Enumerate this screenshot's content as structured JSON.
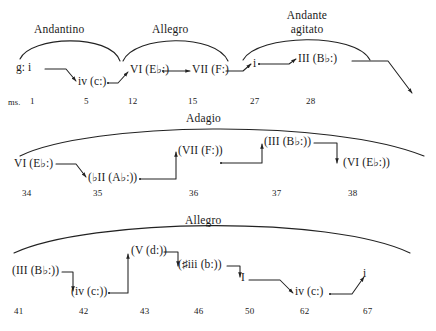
{
  "figure": {
    "type": "harmonic-analysis-diagram",
    "ms_label": "ms.",
    "line_color": "#222222",
    "text_color": "#1a1a1a",
    "background": "#ffffff"
  },
  "rows": [
    {
      "id": "row-1",
      "tempos": [
        {
          "label": "Andantino"
        },
        {
          "label": "Allegro"
        },
        {
          "label": "Andante\nagitato"
        }
      ],
      "tempo_1": "Andantino",
      "tempo_2": "Allegro",
      "tempo_3_line1": "Andante",
      "tempo_3_line2": "agitato",
      "chords": [
        {
          "text": "g: i",
          "roman": "i",
          "key": "g:",
          "measure": "1"
        },
        {
          "text": "iv (c:)",
          "roman": "iv",
          "key": "(c:)",
          "measure": "5"
        },
        {
          "text": "VI (E♭:)",
          "roman": "VI",
          "key": "(E♭:)",
          "measure": "12"
        },
        {
          "text": "VII (F:)",
          "roman": "VII",
          "key": "(F:)",
          "measure": "15"
        },
        {
          "text": "i",
          "roman": "i",
          "key": "",
          "measure": "27"
        },
        {
          "text": "III (B♭:)",
          "roman": "III",
          "key": "(B♭:)",
          "measure": "28"
        }
      ],
      "measures": [
        "1",
        "5",
        "12",
        "15",
        "27",
        "28"
      ]
    },
    {
      "id": "row-2",
      "tempos": [
        {
          "label": "Adagio"
        }
      ],
      "tempo_1": "Adagio",
      "chords": [
        {
          "text": "VI (E♭:)",
          "roman": "VI",
          "key": "(E♭:)",
          "measure": "34"
        },
        {
          "text": "(♭II (A♭:))",
          "roman": "♭II",
          "key": "(A♭:)",
          "measure": "35"
        },
        {
          "text": "(VII (F:))",
          "roman": "VII",
          "key": "(F:)",
          "measure": "36"
        },
        {
          "text": "(III (B♭:))",
          "roman": "III",
          "key": "(B♭:)",
          "measure": "37"
        },
        {
          "text": "(VI (E♭:))",
          "roman": "VI",
          "key": "(E♭:)",
          "measure": "38"
        }
      ],
      "measures": [
        "34",
        "35",
        "36",
        "37",
        "38"
      ]
    },
    {
      "id": "row-3",
      "tempos": [
        {
          "label": "Allegro"
        }
      ],
      "tempo_1": "Allegro",
      "chords": [
        {
          "text": "(III (B♭:))",
          "roman": "III",
          "key": "(B♭:)",
          "measure": "41"
        },
        {
          "text": "(iv (c:))",
          "roman": "iv",
          "key": "(c:)",
          "measure": "42"
        },
        {
          "text": "(V (d:))",
          "roman": "V",
          "key": "(d:)",
          "measure": "43"
        },
        {
          "text": "(♯iii (b:))",
          "roman": "♯iii",
          "key": "(b:)",
          "measure": "46"
        },
        {
          "text": "I",
          "roman": "I",
          "key": "",
          "measure": "50"
        },
        {
          "text": "iv (c:)",
          "roman": "iv",
          "key": "(c:)",
          "measure": "62"
        },
        {
          "text": "i",
          "roman": "i",
          "key": "",
          "measure": "67"
        }
      ],
      "measures": [
        "41",
        "42",
        "43",
        "46",
        "50",
        "62",
        "67"
      ]
    }
  ]
}
